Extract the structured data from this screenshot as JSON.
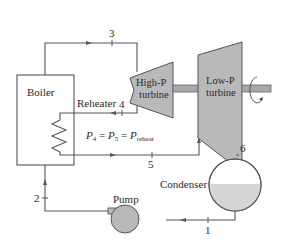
{
  "diagram": {
    "components": {
      "boiler": {
        "label": "Boiler"
      },
      "reheater": {
        "label": "Reheater"
      },
      "hp_turbine": {
        "label_line1": "High-P",
        "label_line2": "turbine"
      },
      "lp_turbine": {
        "label_line1": "Low-P",
        "label_line2": "turbine"
      },
      "condenser": {
        "label": "Condenser"
      },
      "pump": {
        "label": "Pump"
      }
    },
    "states": {
      "s1": "1",
      "s2": "2",
      "s3": "3",
      "s4": "4",
      "s5": "5",
      "s6": "6"
    },
    "equation": {
      "p4": "P",
      "p4_sub": "4",
      "eq1": " = ",
      "p5": "P",
      "p5_sub": "5",
      "eq2": " = ",
      "pr": "P",
      "pr_sub": "reheat"
    },
    "colors": {
      "equipment_fill": "#b9b9b9",
      "equipment_stroke": "#555555",
      "liquid_fill": "#d6d6d6",
      "line": "#555555"
    }
  }
}
